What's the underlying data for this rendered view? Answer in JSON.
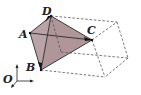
{
  "diagram": {
    "fill_color": "#b8a2a6",
    "edge_color": "#2a2a2a",
    "dash_color": "#555555",
    "points": [
      {
        "name": "A",
        "label": "A"
      },
      {
        "name": "B",
        "label": "B"
      },
      {
        "name": "C",
        "label": "C"
      },
      {
        "name": "D",
        "label": "D"
      }
    ],
    "origin_label": "O",
    "edges_solid": [
      "AD",
      "DC",
      "CB",
      "BA",
      "AC",
      "DB"
    ],
    "edges_dashed_note": "hidden box edges"
  }
}
